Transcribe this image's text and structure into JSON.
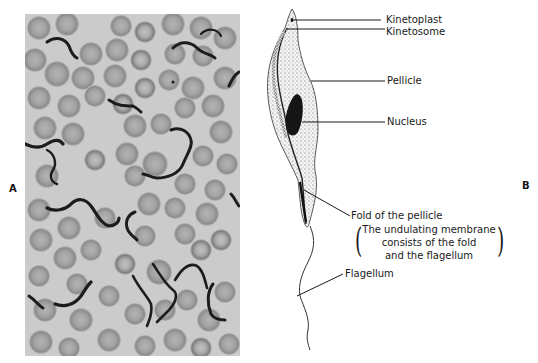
{
  "figure": {
    "panel_a": {
      "letter": "A",
      "description": "Light micrograph of blood smear with trypanosomes among red blood cells"
    },
    "panel_b": {
      "letter": "B",
      "labels": {
        "kinetoplast": "Kinetoplast",
        "kinetosome": "Kinetosome",
        "pellicle": "Pellicle",
        "nucleus": "Nucleus",
        "fold": "Fold of the pellicle",
        "note_line1": "The undulating membrane",
        "note_line2": "consists of the fold",
        "note_line3": "and the flagellum",
        "flagellum": "Flagellum"
      }
    }
  },
  "colors": {
    "photo_bg": "#c9c9c9",
    "rbc_fill": "#9a9a9a",
    "parasite": "#1c1c1c",
    "ink": "#1a1a1a"
  }
}
